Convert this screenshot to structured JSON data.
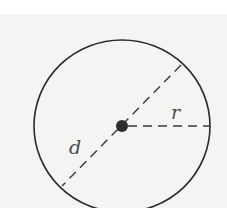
{
  "diagram": {
    "labels": {
      "radius": "r",
      "diameter": "d"
    },
    "colors": {
      "stroke": "#2a2a2a",
      "dash": "#3a3a3a",
      "label": "#4a4a4a",
      "background": "#f4f4f3"
    },
    "geometry": {
      "center": [
        122,
        126
      ],
      "radius_x": 88,
      "radius_y": 86,
      "diameter_endpoints": [
        [
          181,
          65
        ],
        [
          62,
          186
        ]
      ],
      "radius_endpoint": [
        210,
        126
      ]
    }
  }
}
